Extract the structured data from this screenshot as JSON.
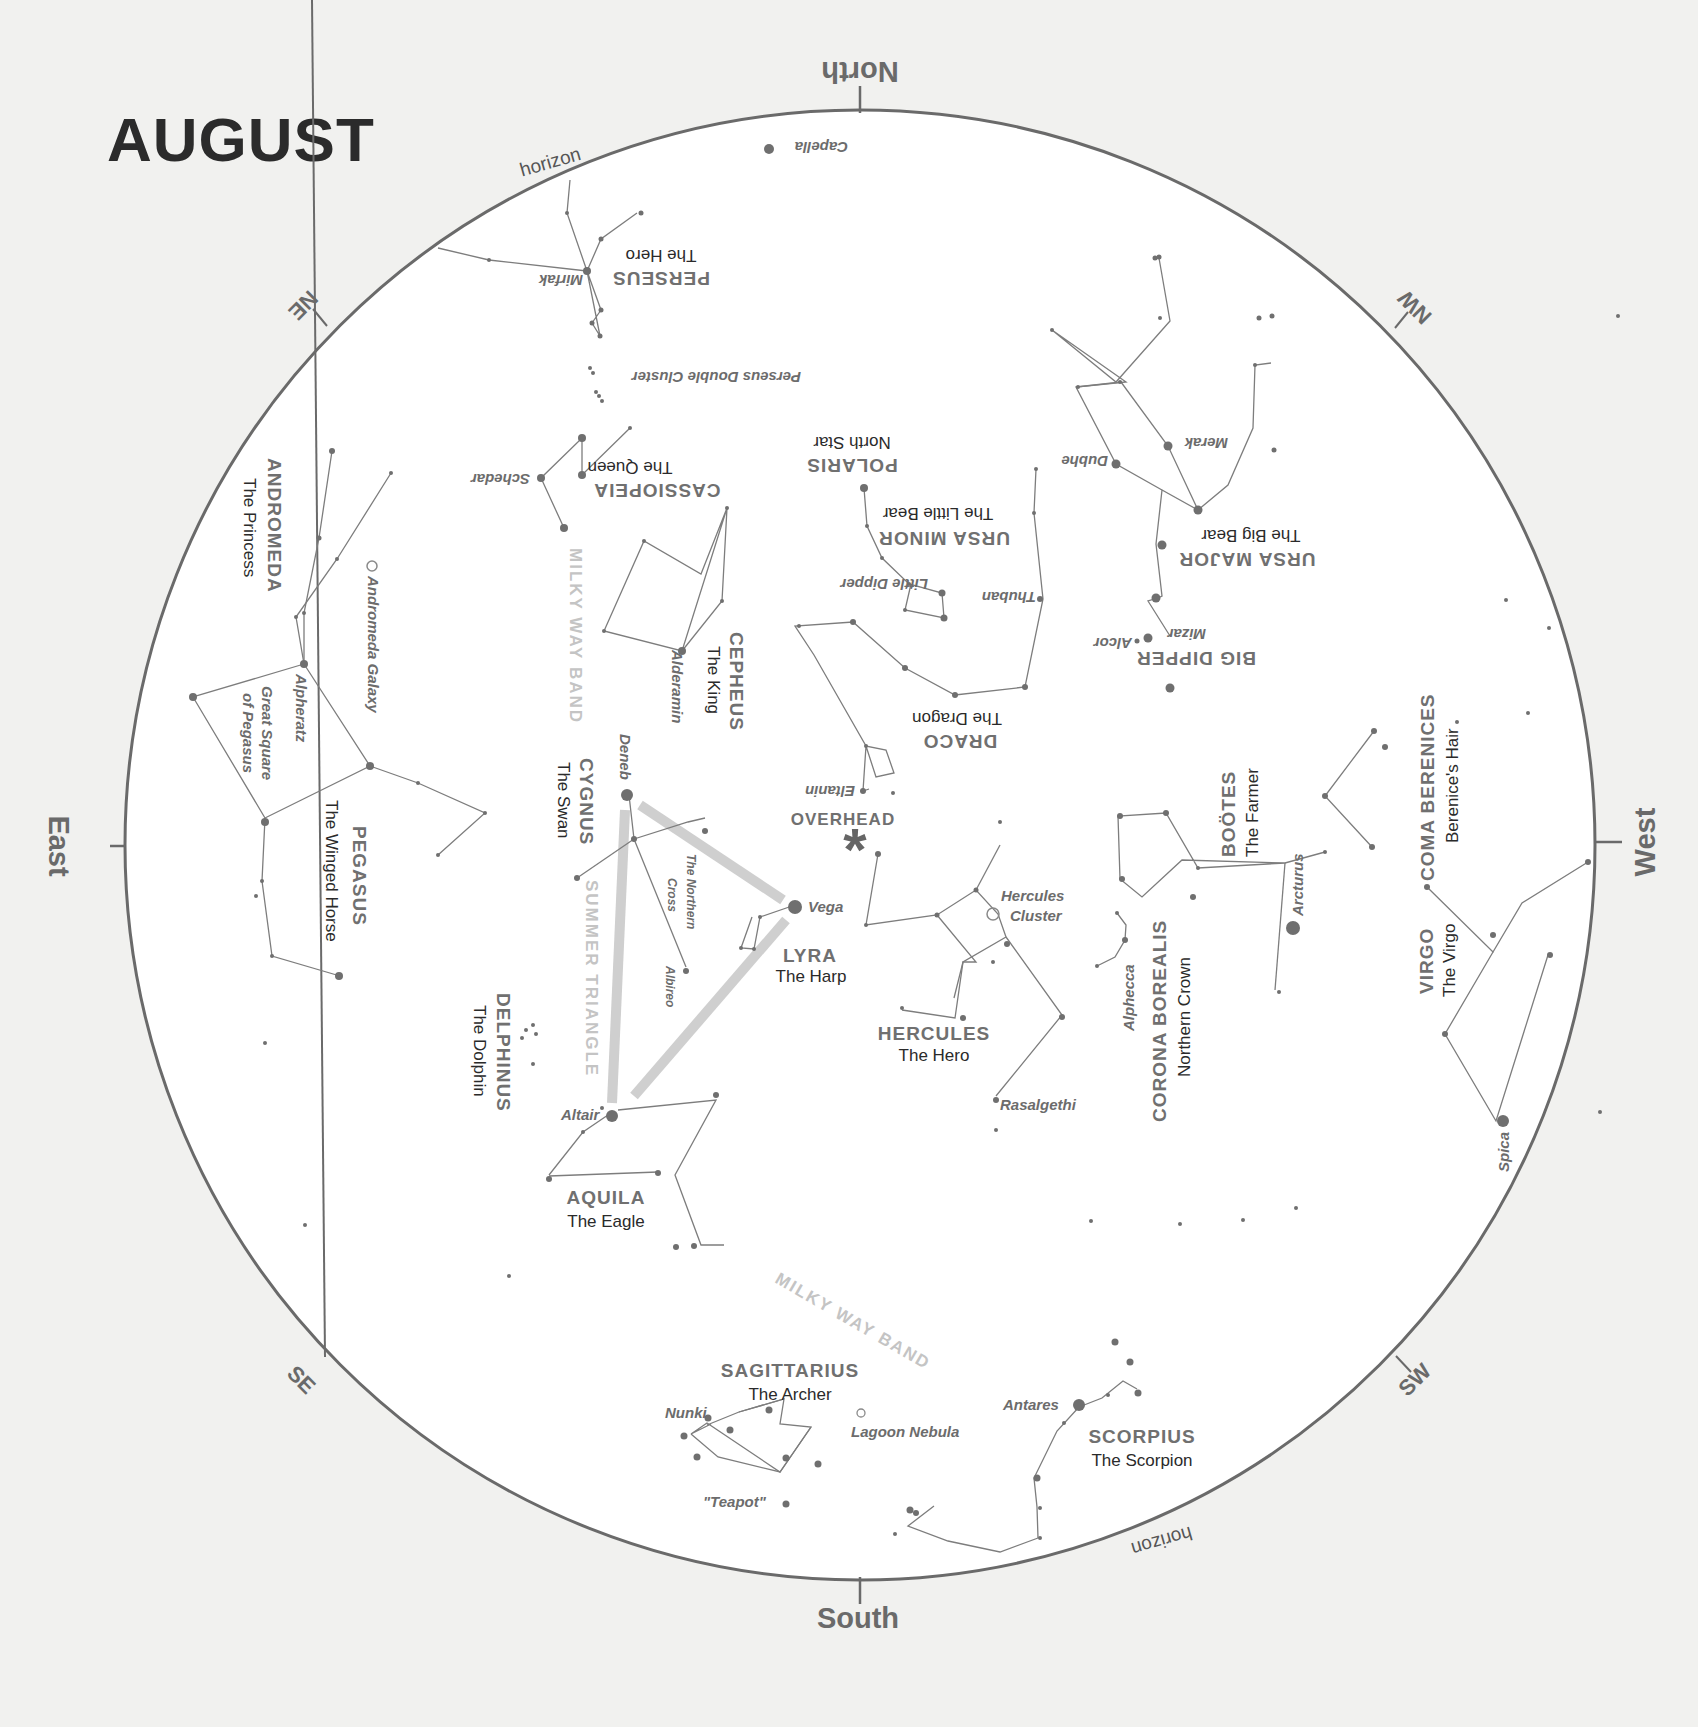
{
  "chart": {
    "title": "AUGUST",
    "directions": {
      "north": "North",
      "south": "South",
      "east": "East",
      "west": "West",
      "ne": "NE",
      "nw": "NW",
      "se": "SE",
      "sw": "SW",
      "horizon_top": "horizon",
      "horizon_bottom": "horizon"
    },
    "overhead": "OVERHEAD",
    "bands": {
      "milky_way_north": "MILKY WAY BAND",
      "milky_way_south": "MILKY WAY BAND",
      "summer_triangle": "SUMMER TRIANGLE"
    },
    "constellations": {
      "perseus": {
        "name": "PERSEUS",
        "sub": "The Hero"
      },
      "cassiopeia": {
        "name": "CASSIOPEIA",
        "sub": "The Queen"
      },
      "polaris": {
        "name": "POLARIS",
        "sub": "North Star"
      },
      "ursa_minor": {
        "name": "URSA MINOR",
        "sub": "The Little Bear"
      },
      "ursa_major": {
        "name": "URSA MAJOR",
        "sub": "The Big Bear"
      },
      "big_dipper": {
        "name": "BIG DIPPER"
      },
      "draco": {
        "name": "DRACO",
        "sub": "The Dragon"
      },
      "andromeda": {
        "name": "ANDROMEDA",
        "sub": "The Princess"
      },
      "cepheus": {
        "name": "CEPHEUS",
        "sub": "The King"
      },
      "cygnus": {
        "name": "CYGNUS",
        "sub": "The Swan"
      },
      "pegasus": {
        "name": "PEGASUS",
        "sub": "The Winged Horse"
      },
      "lyra": {
        "name": "LYRA",
        "sub": "The Harp"
      },
      "hercules": {
        "name": "HERCULES",
        "sub": "The Hero"
      },
      "delphinus": {
        "name": "DELPHINUS",
        "sub": "The Dolphin"
      },
      "aquila": {
        "name": "AQUILA",
        "sub": "The Eagle"
      },
      "corona_borealis": {
        "name": "CORONA BOREALIS",
        "sub": "Northern Crown"
      },
      "bootes": {
        "name": "BOÖTES",
        "sub": "The Farmer"
      },
      "coma_berenices": {
        "name": "COMA BERENICES",
        "sub": "Berenice's Hair"
      },
      "virgo": {
        "name": "VIRGO",
        "sub": "The Virgo"
      },
      "sagittarius": {
        "name": "SAGITTARIUS",
        "sub": "The Archer"
      },
      "scorpius": {
        "name": "SCORPIUS",
        "sub": "The Scorpion"
      }
    },
    "labels": {
      "capella": "Capella",
      "mirfak": "Mirfak",
      "double_cluster": "Perseus Double Cluster",
      "schedar": "Schedar",
      "dubhe": "Dubhe",
      "merak": "Merak",
      "thuban": "Thuban",
      "little_dipper": "Little Dipper",
      "mizar": "Mizar",
      "alcor": "Alcor",
      "eltanin": "Eltanin",
      "alderamin": "Alderamin",
      "andromeda_galaxy": "Andromeda Galaxy",
      "alpheratz": "Alpheratz",
      "great_square_1": "Great Square",
      "great_square_2": "of Pegasus",
      "deneb": "Deneb",
      "northern_cross_1": "The Northern",
      "northern_cross_2": "Cross",
      "albireo": "Albireo",
      "vega": "Vega",
      "hercules_cluster_1": "Hercules",
      "hercules_cluster_2": "Cluster",
      "altair": "Altair",
      "rasalgethi": "Rasalgethi",
      "alphecca": "Alphecca",
      "arcturus": "Arcturus",
      "spica": "Spica",
      "nunki": "Nunki",
      "teapot": "\"Teapot\"",
      "lagoon": "Lagoon Nebula",
      "antares": "Antares"
    },
    "colors": {
      "background": "#f1f1ef",
      "chart_fill": "#ffffff",
      "ring": "#6a6a6a",
      "triangle": "#cfcfcf"
    }
  }
}
